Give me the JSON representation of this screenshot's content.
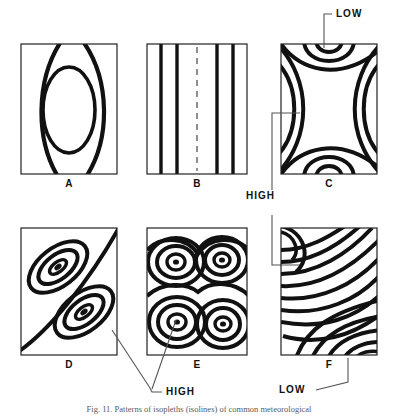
{
  "figure": {
    "panels": [
      {
        "id": "A",
        "label": "A",
        "pattern": "concentric-oval"
      },
      {
        "id": "B",
        "label": "B",
        "pattern": "vertical-straight-lines-with-dashed-axis"
      },
      {
        "id": "C",
        "label": "C",
        "pattern": "saddle-col"
      },
      {
        "id": "D",
        "label": "D",
        "pattern": "two-diagonal-closed-highs"
      },
      {
        "id": "E",
        "label": "E",
        "pattern": "four-closed-highs"
      },
      {
        "id": "F",
        "label": "F",
        "pattern": "curved-trough-lines"
      }
    ],
    "annotations": [
      {
        "name": "low-top",
        "text": "LOW",
        "target": "C",
        "position": "top"
      },
      {
        "name": "high-middle",
        "text": "HIGH",
        "target": "C,F",
        "position": "middle-right-column"
      },
      {
        "name": "high-bottom",
        "text": "HIGH",
        "target": "D,E",
        "position": "bottom-center"
      },
      {
        "name": "low-bottom",
        "text": "LOW",
        "target": "F",
        "position": "bottom-right"
      }
    ],
    "caption": "Fig. 11.  Patterns of isopleths (isolines) of common meteorological",
    "colors": {
      "contour": "#111111",
      "frame": "#222222",
      "leader": "#555555",
      "background": "#ffffff",
      "caption": "#5a5a5a"
    }
  }
}
